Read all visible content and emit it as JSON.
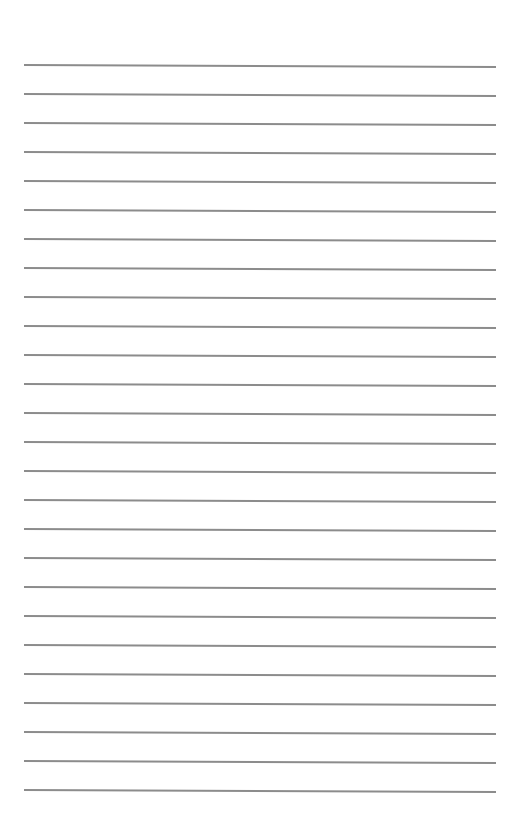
{
  "page": {
    "type": "lined-paper",
    "background_color": "#ffffff",
    "line_color": "#8c8c8c",
    "line_count": 26,
    "first_line_y": 64,
    "line_spacing": 29,
    "line_left_x": 24,
    "line_right_x": 496,
    "text": ""
  }
}
